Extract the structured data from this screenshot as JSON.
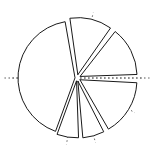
{
  "figure": {
    "title": "",
    "kind": "exploded-pie-chart-line-art",
    "background_color": "#ffffff",
    "outline_color": "#1a1a1a",
    "guide_color": "#5a5a5a",
    "fill_color": "#ffffff",
    "canvas": {
      "width": 151,
      "height": 164
    },
    "center": {
      "x": 77,
      "y": 78
    },
    "radius": 57
  },
  "chart_data": {
    "type": "pie",
    "title": "",
    "xlabel": "",
    "ylabel": "",
    "labels": [
      "Slice 1",
      "Slice 2",
      "Slice 3",
      "Slice 4",
      "Slice 5",
      "Slice 6"
    ],
    "values": [
      41.7,
      11.9,
      14.4,
      15.8,
      6.1,
      6.1
    ],
    "start_angles_deg": [
      100,
      55,
      2,
      -60,
      -85,
      -110
    ],
    "end_angles_deg": [
      250,
      98,
      52,
      -3,
      -63,
      -88
    ],
    "explode": [
      0.035,
      0.06,
      0.06,
      0.06,
      0.055,
      0.05
    ],
    "explode_directions_deg": [
      175,
      76,
      27,
      -31,
      -74,
      -99
    ],
    "guide_angles_deg": [
      0,
      76,
      180,
      -74,
      -99,
      -31
    ],
    "guide_overshoot": 1.18,
    "legend": [],
    "grid": false,
    "annotations": []
  }
}
